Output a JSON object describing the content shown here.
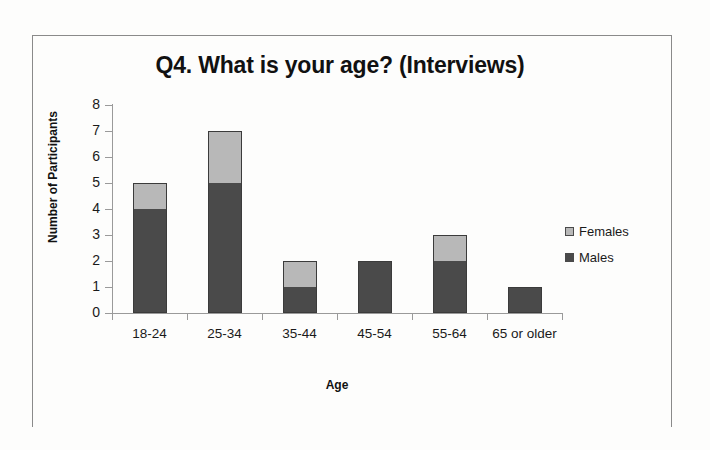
{
  "chart_data": {
    "type": "bar",
    "subtype": "stacked-column",
    "title": "Q4. What is your age? (Interviews)",
    "xlabel": "Age",
    "ylabel": "Number of Participants",
    "categories": [
      "18-24",
      "25-34",
      "35-44",
      "45-54",
      "55-64",
      "65 or older"
    ],
    "series": [
      {
        "name": "Males",
        "values": [
          4,
          5,
          1,
          2,
          2,
          1
        ],
        "color": "#4a4a4a"
      },
      {
        "name": "Females",
        "values": [
          1,
          2,
          1,
          0,
          1,
          0
        ],
        "color": "#b8b8b8"
      }
    ],
    "totals": [
      5,
      7,
      2,
      2,
      3,
      1
    ],
    "ylim": [
      0,
      8
    ],
    "yticks": [
      0,
      1,
      2,
      3,
      4,
      5,
      6,
      7,
      8
    ],
    "ytick_labels": [
      "0",
      "1",
      "2",
      "3",
      "4",
      "5",
      "6",
      "7",
      "8"
    ],
    "grid": false,
    "legend_position": "right",
    "stack_order_bottom_to_top": [
      "Males",
      "Females"
    ]
  },
  "legend": {
    "entries": [
      {
        "label": "Females",
        "color": "#b8b8b8"
      },
      {
        "label": "Males",
        "color": "#4a4a4a"
      }
    ]
  },
  "colors": {
    "males": "#4a4a4a",
    "females": "#b8b8b8",
    "axis": "#9a9a9a",
    "frame": "#8a8a8a",
    "text": "#1a1a1a",
    "background": "#fdfdfc"
  }
}
